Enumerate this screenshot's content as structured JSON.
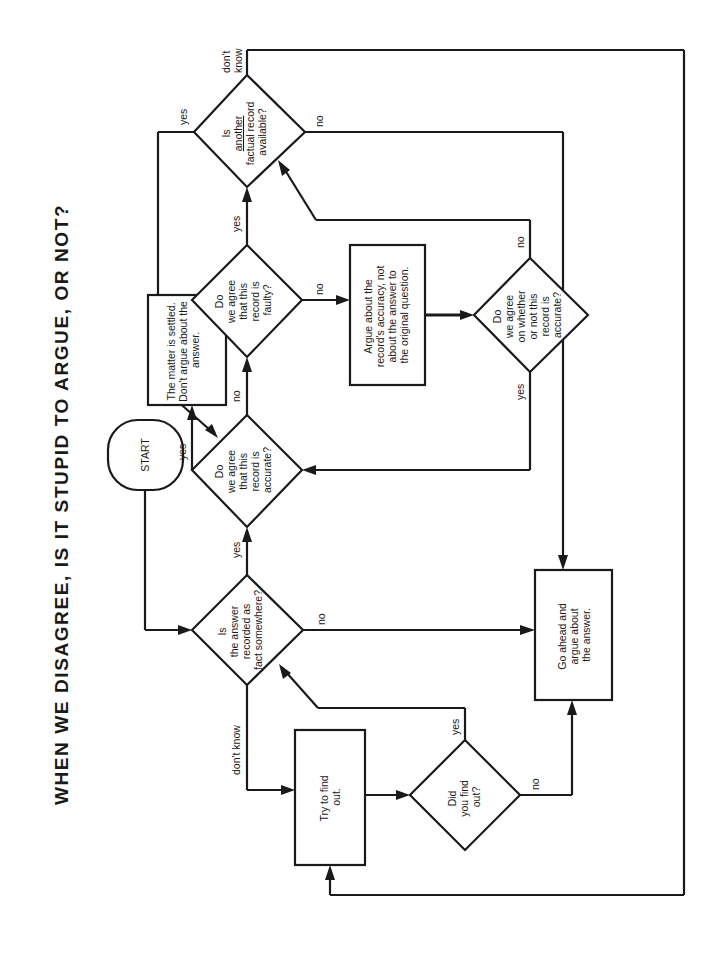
{
  "title": "WHEN WE DISAGREE,  IS  IT  STUPID  TO  ARGUE, OR NOT?",
  "colors": {
    "ink": "#1a1a1a",
    "background": "#ffffff"
  },
  "nodes": {
    "start": {
      "type": "terminal",
      "lines": [
        "START"
      ]
    },
    "recorded_as_fact": {
      "type": "decision",
      "lines": [
        "Is",
        "the answer",
        "recorded as",
        "fact somewhere?"
      ]
    },
    "agree_accurate": {
      "type": "decision",
      "lines": [
        "Do",
        "we agree",
        "that this",
        "record is",
        "accurate?"
      ]
    },
    "settled": {
      "type": "process",
      "lines": [
        "The matter is settled.",
        "Don't argue about the",
        "answer."
      ]
    },
    "agree_faulty": {
      "type": "decision",
      "lines": [
        "Do",
        "we agree",
        "that this",
        "record is",
        "faulty?"
      ]
    },
    "another_record": {
      "type": "decision",
      "lines": [
        "Is",
        "another",
        "factual record",
        "available?"
      ],
      "underline_line": 1
    },
    "argue_accuracy": {
      "type": "process",
      "lines": [
        "Argue about the",
        "record's accuracy, not",
        "about the answer to",
        "the original question."
      ]
    },
    "agree_whether": {
      "type": "decision",
      "lines": [
        "Do",
        "we agree",
        "on whether",
        "or not this",
        "record is",
        "accurate?"
      ]
    },
    "try_find_out": {
      "type": "process",
      "lines": [
        "Try to find",
        "out."
      ]
    },
    "did_find_out": {
      "type": "decision",
      "lines": [
        "Did",
        "you find",
        "out?"
      ]
    },
    "go_ahead": {
      "type": "process",
      "lines": [
        "Go ahead and",
        "argue about",
        "the answer."
      ]
    }
  },
  "edge_labels": {
    "recorded_yes": "yes",
    "recorded_no": "no",
    "recorded_dontknow": "don't know",
    "accurate_yes": "yes",
    "accurate_no": "no",
    "faulty_yes": "yes",
    "faulty_no": "no",
    "another_yes": "yes",
    "another_no": "no",
    "another_dontknow": [
      "don't",
      "know"
    ],
    "whether_yes": "yes",
    "whether_no": "no",
    "found_yes": "yes",
    "found_no": "no"
  },
  "edges": [
    {
      "from": "start",
      "to": "recorded_as_fact",
      "label": ""
    },
    {
      "from": "recorded_as_fact",
      "to": "agree_accurate",
      "label": "yes"
    },
    {
      "from": "recorded_as_fact",
      "to": "go_ahead",
      "label": "no"
    },
    {
      "from": "recorded_as_fact",
      "to": "try_find_out",
      "label": "don't know"
    },
    {
      "from": "agree_accurate",
      "to": "settled",
      "label": "yes"
    },
    {
      "from": "agree_accurate",
      "to": "agree_faulty",
      "label": "no"
    },
    {
      "from": "agree_faulty",
      "to": "another_record",
      "label": "yes"
    },
    {
      "from": "agree_faulty",
      "to": "argue_accuracy",
      "label": "no"
    },
    {
      "from": "argue_accuracy",
      "to": "agree_whether",
      "label": ""
    },
    {
      "from": "agree_whether",
      "to": "agree_accurate",
      "label": "yes"
    },
    {
      "from": "agree_whether",
      "to": "another_record",
      "label": "no"
    },
    {
      "from": "another_record",
      "to": "agree_accurate",
      "label": "yes"
    },
    {
      "from": "another_record",
      "to": "go_ahead",
      "label": "no"
    },
    {
      "from": "another_record",
      "to": "try_find_out",
      "label": "don't know"
    },
    {
      "from": "try_find_out",
      "to": "did_find_out",
      "label": ""
    },
    {
      "from": "did_find_out",
      "to": "recorded_as_fact",
      "label": "yes"
    },
    {
      "from": "did_find_out",
      "to": "go_ahead",
      "label": "no"
    }
  ]
}
